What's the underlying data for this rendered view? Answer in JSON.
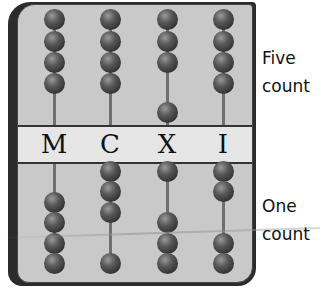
{
  "abacus": {
    "columns": [
      {
        "letter": "M",
        "x": 53,
        "top_beads_y": [
          18,
          40,
          61,
          82
        ],
        "bottom_beads_y": [
          201,
          221,
          242,
          262
        ]
      },
      {
        "letter": "C",
        "x": 109,
        "top_beads_y": [
          18,
          40,
          61,
          82
        ],
        "bottom_beads_y": [
          170,
          190,
          211,
          262
        ]
      },
      {
        "letter": "X",
        "x": 166,
        "top_beads_y": [
          18,
          40,
          61,
          111
        ],
        "bottom_beads_y": [
          170,
          221,
          242,
          262
        ]
      },
      {
        "letter": "I",
        "x": 222,
        "top_beads_y": [
          18,
          40,
          61,
          82
        ],
        "bottom_beads_y": [
          170,
          190,
          242,
          262
        ]
      }
    ],
    "colors": {
      "panel": "#c9c9c9",
      "band": "#e6e6e6",
      "frame": "#2b2b2b",
      "bead": "#3a3a3a",
      "rod": "#6f6f6f"
    }
  },
  "labels": {
    "five": {
      "line1": "Five",
      "line2": "count"
    },
    "one": {
      "line1": "One",
      "line2": "count"
    }
  }
}
